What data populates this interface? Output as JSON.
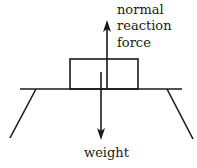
{
  "diagram": {
    "type": "free-body force diagram",
    "labels": {
      "normal_line1": "normal",
      "normal_line2": "reaction",
      "normal_line3": "force",
      "weight": "weight"
    },
    "colors": {
      "stroke": "#1a1a1a",
      "background": "#ffffff"
    },
    "elements": {
      "table_top": {
        "x1": 20,
        "y1": 89,
        "x2": 182,
        "y2": 89
      },
      "left_leg": {
        "x1": 36,
        "y1": 89,
        "x2": 10,
        "y2": 138
      },
      "right_leg": {
        "x1": 167,
        "y1": 89,
        "x2": 193,
        "y2": 139
      },
      "block": {
        "x": 70,
        "y": 59,
        "w": 68,
        "h": 30
      },
      "normal_arrow": {
        "x": 107,
        "from_y": 89,
        "to_y": 20,
        "direction": "up"
      },
      "weight_arrow": {
        "x": 101,
        "from_y": 72,
        "to_y": 140,
        "direction": "down"
      }
    }
  }
}
